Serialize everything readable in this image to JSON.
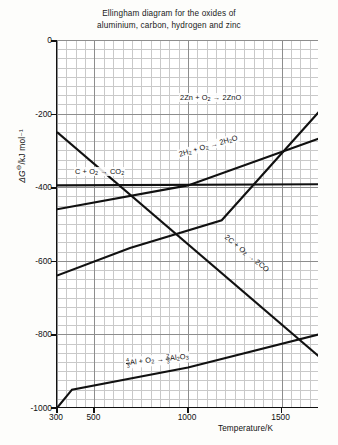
{
  "chart_data": {
    "type": "line",
    "title": "Ellingham diagram for the oxides of aluminium, carbon, hydrogen and zinc",
    "title_line1": "Ellingham diagram for the oxides of",
    "title_line2": "aluminium, carbon, hydrogen and zinc",
    "xlabel": "Temperature/K",
    "ylabel": "ΔGᵒ/kJ mol⁻¹",
    "ylabel_symbol": "ΔG",
    "ylabel_super": "⊖",
    "ylabel_rest": "/kJ mol⁻¹",
    "xlim": [
      300,
      1700
    ],
    "ylim": [
      -1000,
      0
    ],
    "xticks": [
      300,
      500,
      1000,
      1500
    ],
    "yticks": [
      0,
      -200,
      -400,
      -600,
      -800,
      -1000
    ],
    "grid": true,
    "grid_minor_x_step": 50,
    "grid_minor_y_step": 25,
    "legend": "inline-labels",
    "series": [
      {
        "name": "2Zn + O2 -> 2ZnO",
        "label": "2Zn + O",
        "label_sub1": "2",
        "label_mid": " → 2ZnO",
        "points": [
          [
            300,
            -640
          ],
          [
            690,
            -565
          ],
          [
            1180,
            -490
          ],
          [
            1700,
            -195
          ]
        ],
        "label_x": 1180,
        "label_y": -150
      },
      {
        "name": "2H2 + O2 -> 2H2O",
        "label_a": "2H",
        "label_a_sub": "2",
        "label_b": " + O",
        "label_b_sub": "2",
        "label_c": " → 2H",
        "label_c_sub": "2",
        "label_d": "O",
        "points": [
          [
            300,
            -460
          ],
          [
            1000,
            -395
          ],
          [
            1700,
            -268
          ]
        ],
        "rotation": -17
      },
      {
        "name": "C + O2 -> CO2",
        "label_a": "C + O",
        "label_a_sub": "2",
        "label_b": " → CO",
        "label_b_sub": "2",
        "points": [
          [
            300,
            -395
          ],
          [
            1700,
            -392
          ]
        ],
        "label_x": 420,
        "label_y": -350
      },
      {
        "name": "2C + O2 -> 2CO",
        "label_a": "2C + O",
        "label_a_sub": "2",
        "label_b": " → 2CO",
        "points": [
          [
            300,
            -250
          ],
          [
            1700,
            -860
          ]
        ],
        "rotation": 38
      },
      {
        "name": "4/3Al + O2 -> 2/3Al2O3",
        "label_num1": "4",
        "label_den1": "3",
        "label_a": "Al + O",
        "label_a_sub": "2",
        "label_b": " → ",
        "label_num2": "2",
        "label_den2": "3",
        "label_c": "Al",
        "label_c_sub": "2",
        "label_d": "O",
        "label_d_sub": "3",
        "points": [
          [
            300,
            -1000
          ],
          [
            380,
            -950
          ],
          [
            1000,
            -890
          ],
          [
            1700,
            -800
          ]
        ]
      }
    ]
  }
}
